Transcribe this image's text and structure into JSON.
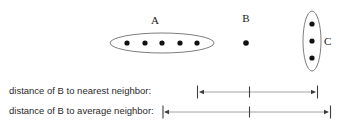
{
  "figure": {
    "background_color": "#ffffff",
    "line_color": "#9a9a9a",
    "blob_stroke_color": "#6e6e6e",
    "dot_color": "#111111",
    "text_color": "#2b2b2b"
  },
  "clusters": [
    {
      "id": "A",
      "label": "A",
      "label_x": 155,
      "label_y": 24,
      "shape": "horizontal-ellipse",
      "cx": 162,
      "cy": 43,
      "rx": 52,
      "ry": 10,
      "point_count": 5,
      "points": [
        {
          "x": 127,
          "y": 43
        },
        {
          "x": 145,
          "y": 43
        },
        {
          "x": 162,
          "y": 43
        },
        {
          "x": 180,
          "y": 43
        },
        {
          "x": 197,
          "y": 43
        }
      ]
    },
    {
      "id": "B",
      "label": "B",
      "label_x": 246,
      "label_y": 22,
      "shape": "none",
      "point_count": 1,
      "points": [
        {
          "x": 246,
          "y": 43
        }
      ]
    },
    {
      "id": "C",
      "label": "C",
      "label_x": 327,
      "label_y": 45,
      "shape": "vertical-ellipse",
      "cx": 312,
      "cy": 41,
      "rx": 9,
      "ry": 30,
      "point_count": 3,
      "points": [
        {
          "x": 312,
          "y": 24
        },
        {
          "x": 312,
          "y": 41
        },
        {
          "x": 312,
          "y": 58
        }
      ]
    }
  ],
  "measures": [
    {
      "id": "nearest",
      "label": "distance of B to nearest neighbor:",
      "label_x": 9,
      "label_y": 94,
      "line_y": 92,
      "start_x": 198,
      "end_x": 317,
      "tick_x": 249,
      "left_cap": true,
      "right_cap": true,
      "left_arrow": true,
      "right_arrow": true
    },
    {
      "id": "average",
      "label": "distance of B to average neighbor:",
      "label_x": 9,
      "label_y": 114,
      "line_y": 112,
      "start_x": 163,
      "end_x": 330,
      "tick_x": 249,
      "left_cap": true,
      "right_cap": true,
      "left_arrow": true,
      "right_arrow": true
    }
  ]
}
